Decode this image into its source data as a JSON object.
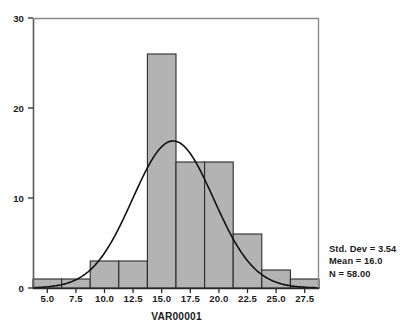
{
  "chart_data": {
    "type": "bar",
    "title": "",
    "subtitle": "",
    "xlabel": "VAR00001",
    "ylabel": "",
    "xlim": [
      3.75,
      28.75
    ],
    "ylim": [
      0,
      30
    ],
    "grid": false,
    "legend_position": "right-bottom",
    "bin_width": 2.5,
    "categories": [
      "3.75-6.25",
      "6.25-8.75",
      "8.75-11.25",
      "11.25-13.75",
      "13.75-16.25",
      "16.25-18.75",
      "18.75-21.25",
      "21.25-23.75",
      "23.75-26.25",
      "26.25-28.75"
    ],
    "bin_edges": [
      3.75,
      6.25,
      8.75,
      11.25,
      13.75,
      16.25,
      18.75,
      21.25,
      23.75,
      26.25,
      28.75
    ],
    "bin_centers": [
      5.0,
      7.5,
      10.0,
      12.5,
      15.0,
      17.5,
      20.0,
      22.5,
      25.0,
      27.5
    ],
    "values": [
      1,
      1,
      3,
      3,
      26,
      14,
      14,
      6,
      2,
      1
    ],
    "xticks": [
      "5.0",
      "7.5",
      "10.0",
      "12.5",
      "15.0",
      "17.5",
      "20.0",
      "22.5",
      "25.0",
      "27.5"
    ],
    "xtick_values": [
      5.0,
      7.5,
      10.0,
      12.5,
      15.0,
      17.5,
      20.0,
      22.5,
      25.0,
      27.5
    ],
    "yticks": [
      "0",
      "10",
      "20",
      "30"
    ],
    "ytick_values": [
      0,
      10,
      20,
      30
    ],
    "overlay": {
      "type": "normal-curve",
      "mean": 16.0,
      "std_dev": 3.54,
      "n": 58.0,
      "peak_value": 16.3
    },
    "colors": {
      "bar_fill": "#b3b3b3",
      "bar_stroke": "#2b2b2b",
      "curve": "#111111",
      "axis": "#555555",
      "text": "#1b1b1b",
      "background": "#ffffff"
    }
  },
  "legend": {
    "std_dev": "Std. Dev = 3.54",
    "mean": "Mean = 16.0",
    "n": "N = 58.00"
  }
}
